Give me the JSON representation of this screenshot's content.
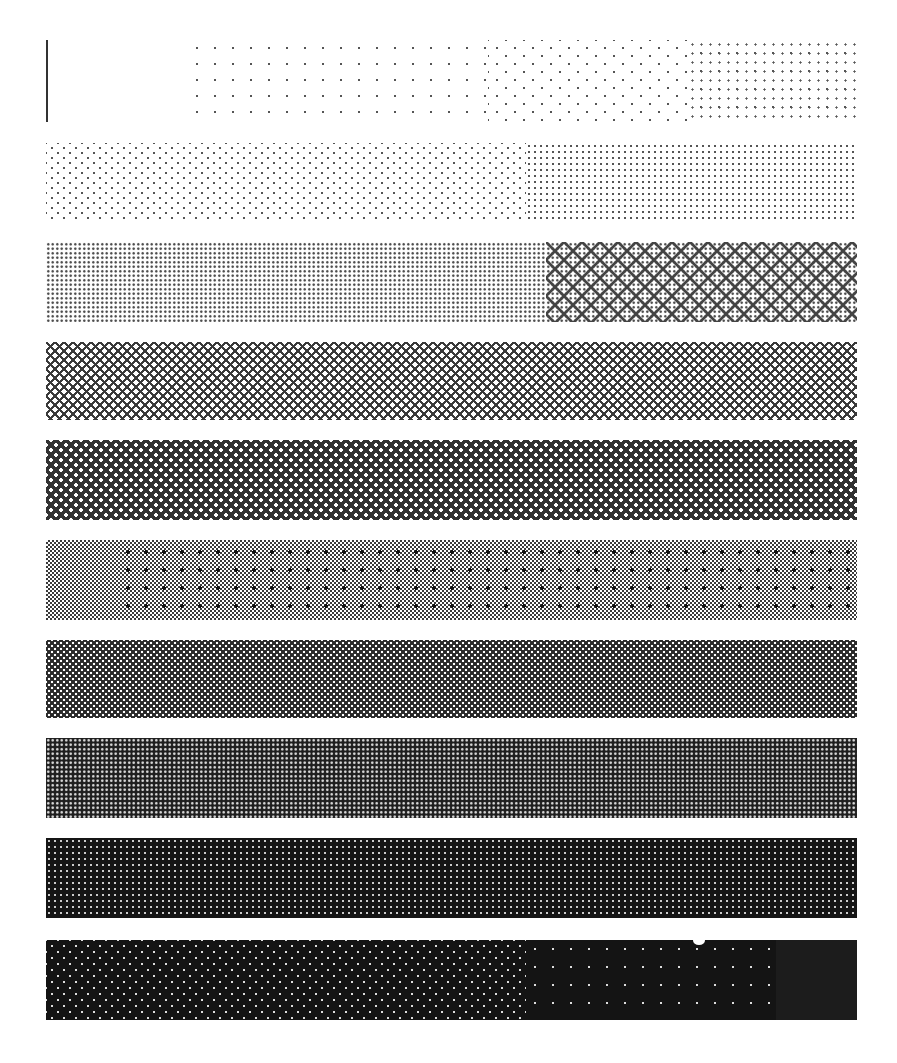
{
  "bands": [
    {
      "index": 1,
      "tone": "lightest",
      "pattern": "sparse dots",
      "colors": {
        "ink": "#555555",
        "paper": "#ffffff"
      }
    },
    {
      "index": 2,
      "tone": "very light",
      "pattern": "offset dot grid",
      "colors": {
        "ink": "#555555",
        "paper": "#ffffff"
      }
    },
    {
      "index": 3,
      "tone": "light",
      "pattern": "dense dot grid with x-marks",
      "colors": {
        "ink": "#444444",
        "paper": "#ffffff"
      }
    },
    {
      "index": 4,
      "tone": "light-mid",
      "pattern": "cross-hatch x grid",
      "colors": {
        "ink": "#3a3a3a",
        "paper": "#ffffff"
      }
    },
    {
      "index": 5,
      "tone": "mid",
      "pattern": "diamond lattice",
      "colors": {
        "ink": "#333333",
        "paper": "#ffffff"
      }
    },
    {
      "index": 6,
      "tone": "50 percent",
      "pattern": "checkerboard with dark dots",
      "colors": {
        "ink": "#3a3a3a",
        "paper": "#ffffff"
      }
    },
    {
      "index": 7,
      "tone": "mid-dark",
      "pattern": "dark lattice with light holes",
      "colors": {
        "ink": "#2a2a2a",
        "paper": "#ffffff"
      }
    },
    {
      "index": 8,
      "tone": "dark",
      "pattern": "dark with dense light dots",
      "colors": {
        "ink": "#1e1e1e",
        "paper": "#dddddd"
      }
    },
    {
      "index": 9,
      "tone": "darker",
      "pattern": "dark with sparse light dots",
      "colors": {
        "ink": "#151515",
        "paper": "#cccccc"
      }
    },
    {
      "index": 10,
      "tone": "darkest",
      "pattern": "near solid black with faint dots",
      "colors": {
        "ink": "#141414",
        "paper": "#dddddd"
      }
    }
  ]
}
